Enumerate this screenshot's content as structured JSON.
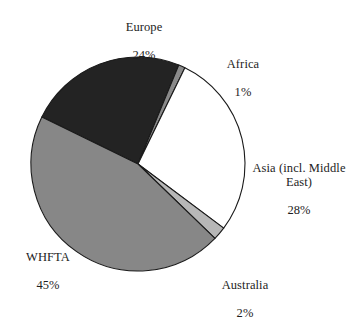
{
  "chart_data": {
    "type": "pie",
    "title": "",
    "xlabel": "",
    "ylabel": "",
    "unit": "%",
    "legend_position": "callout-labels",
    "grid": false,
    "center": {
      "x": 138,
      "y": 164
    },
    "radius": 107,
    "categories": [
      "Europe",
      "Africa",
      "Asia (incl. Middle East)",
      "Australia",
      "WHFTA"
    ],
    "values": [
      24,
      1,
      28,
      2,
      45
    ],
    "colors": [
      "#232323",
      "#8a8a8a",
      "#ffffff",
      "#b7b7b7",
      "#878787"
    ],
    "stroke": "#1a1a1a",
    "start_angle_deg": -64,
    "slices": [
      {
        "name": "Europe",
        "value": 24,
        "label": "Europe",
        "percent_text": "24%",
        "color": "#232323"
      },
      {
        "name": "Africa",
        "value": 1,
        "label": "Africa",
        "percent_text": "1%",
        "color": "#8a8a8a"
      },
      {
        "name": "Asia",
        "value": 28,
        "label": "Asia (incl. Middle\nEast)",
        "percent_text": "28%",
        "color": "#ffffff"
      },
      {
        "name": "Australia",
        "value": 2,
        "label": "Australia",
        "percent_text": "2%",
        "color": "#b7b7b7"
      },
      {
        "name": "WHFTA",
        "value": 45,
        "label": "WHFTA",
        "percent_text": "45%",
        "color": "#878787"
      }
    ]
  },
  "labels": {
    "europe": {
      "name": "Europe",
      "percent": "24%"
    },
    "africa": {
      "name": "Africa",
      "percent": "1%"
    },
    "asia": {
      "name": "Asia (incl. Middle\nEast)",
      "percent": "28%"
    },
    "australia": {
      "name": "Australia",
      "percent": "2%"
    },
    "whfta": {
      "name": "WHFTA",
      "percent": "45%"
    }
  },
  "artifacts": {
    "top_cropped_text": ""
  }
}
